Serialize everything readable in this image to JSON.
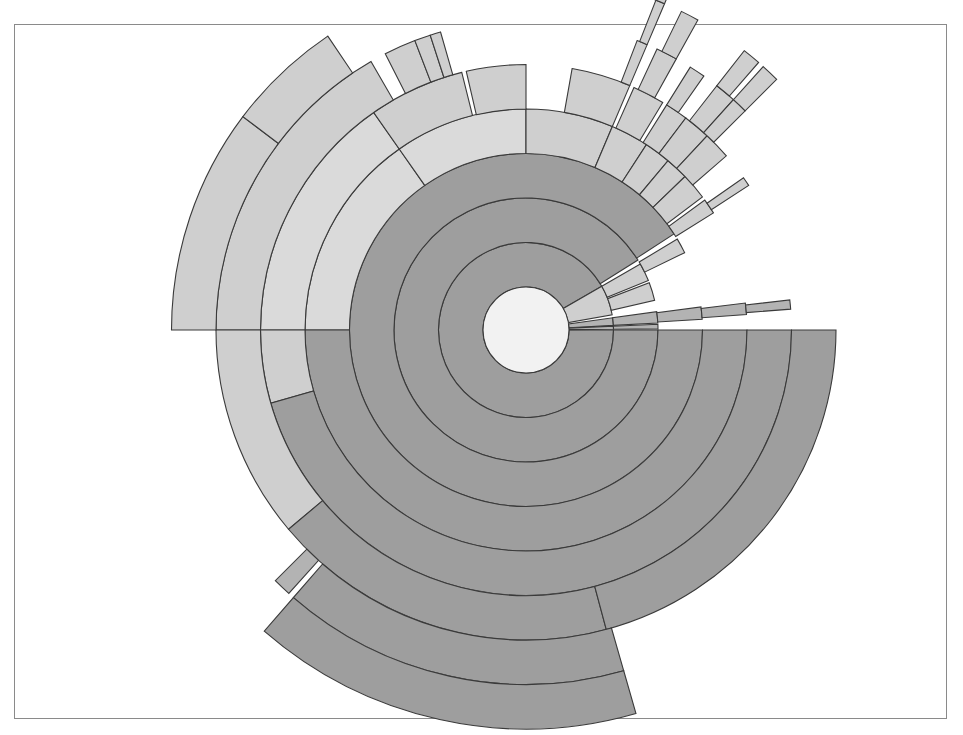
{
  "chart_data": {
    "type": "sunburst",
    "title": "",
    "center": {
      "x": 526,
      "y": 330
    },
    "center_radius": 43,
    "ring_width": 44.5,
    "angle_convention": "degrees, 0 = east, counter-clockwise positive",
    "colors": {
      "center": "#f2f2f2",
      "dark": "#9e9e9e",
      "medium": "#b3b3b3",
      "light": "#cfcfcf",
      "lighter": "#dadada",
      "stroke": "#3a3a3a"
    },
    "segments": [
      {
        "ring": 1,
        "start": 30,
        "end": 360,
        "shade": "dark"
      },
      {
        "ring": 1,
        "start": 10,
        "end": 30,
        "shade": "light"
      },
      {
        "ring": 1,
        "start": 3,
        "end": 8,
        "shade": "medium"
      },
      {
        "ring": 1,
        "start": 0.5,
        "end": 2.5,
        "shade": "medium"
      },
      {
        "ring": 2,
        "start": 32,
        "end": 360,
        "shade": "dark"
      },
      {
        "ring": 2,
        "start": 22,
        "end": 30,
        "shade": "light"
      },
      {
        "ring": 2,
        "start": 13,
        "end": 21,
        "shade": "light"
      },
      {
        "ring": 2,
        "start": 3,
        "end": 8,
        "shade": "medium"
      },
      {
        "ring": 2,
        "start": 0.5,
        "end": 2.5,
        "shade": "medium"
      },
      {
        "ring": 3,
        "start": 33,
        "end": 360,
        "shade": "dark"
      },
      {
        "ring": 3,
        "start": 26,
        "end": 31,
        "shade": "light"
      },
      {
        "ring": 3,
        "start": 3.5,
        "end": 7.5,
        "shade": "medium"
      },
      {
        "ring": 4,
        "start": 125,
        "end": 180,
        "shade": "lighter"
      },
      {
        "ring": 4,
        "start": 90,
        "end": 125,
        "shade": "lighter"
      },
      {
        "ring": 4,
        "start": 67,
        "end": 90,
        "shade": "light"
      },
      {
        "ring": 4,
        "start": 57,
        "end": 67,
        "shade": "light"
      },
      {
        "ring": 4,
        "start": 50,
        "end": 57,
        "shade": "light"
      },
      {
        "ring": 4,
        "start": 44,
        "end": 50,
        "shade": "light"
      },
      {
        "ring": 4,
        "start": 37,
        "end": 44,
        "shade": "light"
      },
      {
        "ring": 4,
        "start": 32,
        "end": 36,
        "shade": "light"
      },
      {
        "ring": 4,
        "start": 4,
        "end": 7,
        "shade": "medium"
      },
      {
        "ring": 4,
        "start": 180,
        "end": 360,
        "shade": "dark"
      },
      {
        "ring": 5,
        "start": 125,
        "end": 180,
        "shade": "lighter"
      },
      {
        "ring": 5,
        "start": 104,
        "end": 125,
        "shade": "light"
      },
      {
        "ring": 5,
        "start": 90,
        "end": 103,
        "shade": "light"
      },
      {
        "ring": 5,
        "start": 67,
        "end": 80,
        "shade": "light"
      },
      {
        "ring": 5,
        "start": 59,
        "end": 66,
        "shade": "light"
      },
      {
        "ring": 5,
        "start": 53,
        "end": 58,
        "shade": "light"
      },
      {
        "ring": 5,
        "start": 47,
        "end": 53,
        "shade": "light"
      },
      {
        "ring": 5,
        "start": 41,
        "end": 47,
        "shade": "light"
      },
      {
        "ring": 5,
        "start": 33,
        "end": 35,
        "shade": "light"
      },
      {
        "ring": 5,
        "start": 4.5,
        "end": 6.5,
        "shade": "medium"
      },
      {
        "ring": 5,
        "start": 180,
        "end": 196,
        "shade": "light"
      },
      {
        "ring": 5,
        "start": 196,
        "end": 360,
        "shade": "dark"
      },
      {
        "ring": 6,
        "start": 120,
        "end": 180,
        "shade": "light"
      },
      {
        "ring": 6,
        "start": 111,
        "end": 117,
        "shade": "light"
      },
      {
        "ring": 6,
        "start": 108,
        "end": 111,
        "shade": "light"
      },
      {
        "ring": 6,
        "start": 106,
        "end": 108,
        "shade": "light"
      },
      {
        "ring": 6,
        "start": 67,
        "end": 69,
        "shade": "light"
      },
      {
        "ring": 6,
        "start": 61,
        "end": 65,
        "shade": "light"
      },
      {
        "ring": 6,
        "start": 55,
        "end": 58,
        "shade": "light"
      },
      {
        "ring": 6,
        "start": 48,
        "end": 52,
        "shade": "light"
      },
      {
        "ring": 6,
        "start": 45,
        "end": 48,
        "shade": "light"
      },
      {
        "ring": 6,
        "start": 180,
        "end": 220,
        "shade": "light"
      },
      {
        "ring": 6,
        "start": 220,
        "end": 285,
        "shade": "dark"
      },
      {
        "ring": 6,
        "start": 285,
        "end": 360,
        "shade": "dark"
      },
      {
        "ring": 7,
        "start": 143,
        "end": 180,
        "shade": "light"
      },
      {
        "ring": 7,
        "start": 124,
        "end": 143,
        "shade": "light"
      },
      {
        "ring": 7,
        "start": 67,
        "end": 68.5,
        "shade": "light"
      },
      {
        "ring": 7,
        "start": 61,
        "end": 64,
        "shade": "light"
      },
      {
        "ring": 7,
        "start": 49,
        "end": 52,
        "shade": "light"
      },
      {
        "ring": 7,
        "start": 45,
        "end": 48,
        "shade": "light"
      },
      {
        "ring": 7,
        "start": 225,
        "end": 228,
        "shade": "medium"
      },
      {
        "ring": 7,
        "start": 229,
        "end": 286,
        "shade": "dark"
      },
      {
        "ring": 8,
        "start": 229,
        "end": 286,
        "shade": "dark"
      },
      {
        "ring": 8,
        "start": 67,
        "end": 69,
        "shade": "light"
      }
    ]
  }
}
